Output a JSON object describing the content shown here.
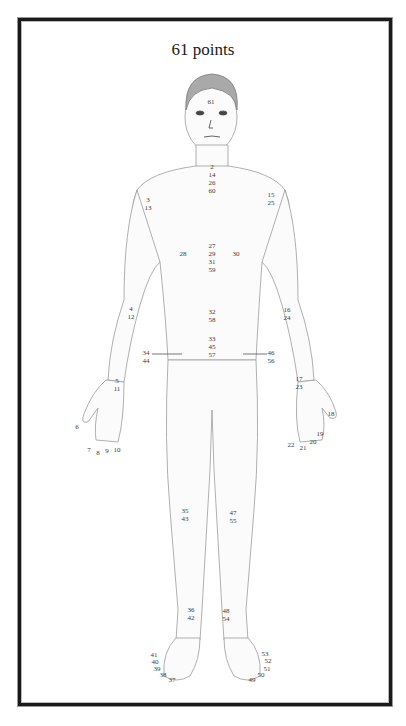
{
  "title": "61 points",
  "labels": [
    {
      "id": "head",
      "text": "61",
      "x": 211,
      "y": 98
    },
    {
      "id": "neck",
      "text": "2\n14\n26\n60",
      "x": 212,
      "y": 163
    },
    {
      "id": "left-shoulder",
      "text": "3\n13",
      "x": 148,
      "y": 196
    },
    {
      "id": "right-shoulder",
      "text": "15\n25",
      "x": 271,
      "y": 191
    },
    {
      "id": "left-chest",
      "text": "28",
      "x": 183,
      "y": 250
    },
    {
      "id": "sternum",
      "text": "27\n29\n31\n59",
      "x": 212,
      "y": 242
    },
    {
      "id": "right-chest",
      "text": "30",
      "x": 236,
      "y": 250
    },
    {
      "id": "left-elbow",
      "text": "4\n12",
      "x": 131,
      "y": 305
    },
    {
      "id": "right-elbow",
      "text": "16\n24",
      "x": 287,
      "y": 306
    },
    {
      "id": "navel-upper",
      "text": "32\n58",
      "x": 212,
      "y": 308
    },
    {
      "id": "lower-abdomen",
      "text": "33\n45\n57",
      "x": 212,
      "y": 335
    },
    {
      "id": "left-hip",
      "text": "34\n44",
      "x": 146,
      "y": 349
    },
    {
      "id": "right-hip",
      "text": "46\n56",
      "x": 271,
      "y": 349
    },
    {
      "id": "left-wrist",
      "text": "5\n11",
      "x": 117,
      "y": 377
    },
    {
      "id": "right-wrist",
      "text": "17\n23",
      "x": 299,
      "y": 375
    },
    {
      "id": "left-thumb",
      "text": "6",
      "x": 77,
      "y": 423
    },
    {
      "id": "left-finger-7",
      "text": "7",
      "x": 89,
      "y": 446
    },
    {
      "id": "left-finger-8",
      "text": "8",
      "x": 98,
      "y": 449
    },
    {
      "id": "left-finger-9",
      "text": "9",
      "x": 107,
      "y": 447
    },
    {
      "id": "left-finger-10",
      "text": "10",
      "x": 117,
      "y": 446
    },
    {
      "id": "right-thumb",
      "text": "18",
      "x": 331,
      "y": 410
    },
    {
      "id": "right-finger-19",
      "text": "19",
      "x": 320,
      "y": 430
    },
    {
      "id": "right-finger-20",
      "text": "20",
      "x": 313,
      "y": 438
    },
    {
      "id": "right-finger-21",
      "text": "21",
      "x": 303,
      "y": 444
    },
    {
      "id": "right-finger-22",
      "text": "22",
      "x": 291,
      "y": 441
    },
    {
      "id": "left-knee",
      "text": "35\n43",
      "x": 185,
      "y": 507
    },
    {
      "id": "right-knee",
      "text": "47\n55",
      "x": 233,
      "y": 509
    },
    {
      "id": "left-ankle",
      "text": "36\n42",
      "x": 191,
      "y": 606
    },
    {
      "id": "right-ankle",
      "text": "48\n54",
      "x": 226,
      "y": 607
    },
    {
      "id": "left-toe-41",
      "text": "41",
      "x": 154,
      "y": 651
    },
    {
      "id": "left-toe-40",
      "text": "40",
      "x": 155,
      "y": 658
    },
    {
      "id": "left-toe-39",
      "text": "39",
      "x": 157,
      "y": 665
    },
    {
      "id": "left-toe-38",
      "text": "38",
      "x": 163,
      "y": 671
    },
    {
      "id": "left-toe-37",
      "text": "37",
      "x": 172,
      "y": 676
    },
    {
      "id": "right-toe-53",
      "text": "53",
      "x": 265,
      "y": 650
    },
    {
      "id": "right-toe-52",
      "text": "52",
      "x": 268,
      "y": 657
    },
    {
      "id": "right-toe-51",
      "text": "51",
      "x": 267,
      "y": 665
    },
    {
      "id": "right-toe-50",
      "text": "50",
      "x": 261,
      "y": 671
    },
    {
      "id": "right-toe-49",
      "text": "49",
      "x": 252,
      "y": 676
    }
  ]
}
